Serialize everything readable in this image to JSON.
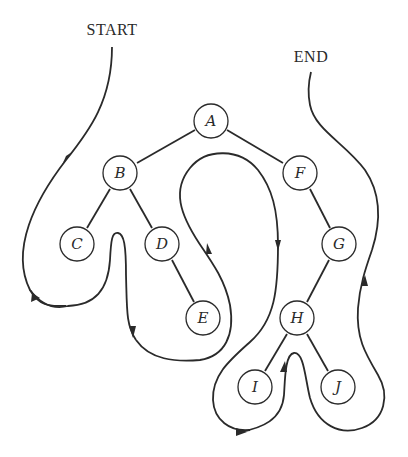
{
  "diagram": {
    "type": "tree-traversal",
    "start_label": "START",
    "end_label": "END",
    "nodes": [
      {
        "id": "A",
        "label": "A",
        "x": 211,
        "y": 121
      },
      {
        "id": "B",
        "label": "B",
        "x": 120,
        "y": 173
      },
      {
        "id": "F",
        "label": "F",
        "x": 300,
        "y": 173
      },
      {
        "id": "C",
        "label": "C",
        "x": 77,
        "y": 244
      },
      {
        "id": "D",
        "label": "D",
        "x": 162,
        "y": 244
      },
      {
        "id": "E",
        "label": "E",
        "x": 203,
        "y": 318
      },
      {
        "id": "G",
        "label": "G",
        "x": 339,
        "y": 244
      },
      {
        "id": "H",
        "label": "H",
        "x": 297,
        "y": 318
      },
      {
        "id": "I",
        "label": "I",
        "x": 255,
        "y": 387
      },
      {
        "id": "J",
        "label": "J",
        "x": 338,
        "y": 387
      }
    ],
    "edges": [
      [
        "A",
        "B"
      ],
      [
        "A",
        "F"
      ],
      [
        "B",
        "C"
      ],
      [
        "B",
        "D"
      ],
      [
        "D",
        "E"
      ],
      [
        "F",
        "G"
      ],
      [
        "G",
        "H"
      ],
      [
        "H",
        "I"
      ],
      [
        "H",
        "J"
      ]
    ],
    "traversal_order": [
      "A",
      "B",
      "C",
      "D",
      "E",
      "F",
      "G",
      "H",
      "I",
      "J"
    ],
    "colors": {
      "ink": "#2a2a2a",
      "background": "#ffffff"
    }
  }
}
